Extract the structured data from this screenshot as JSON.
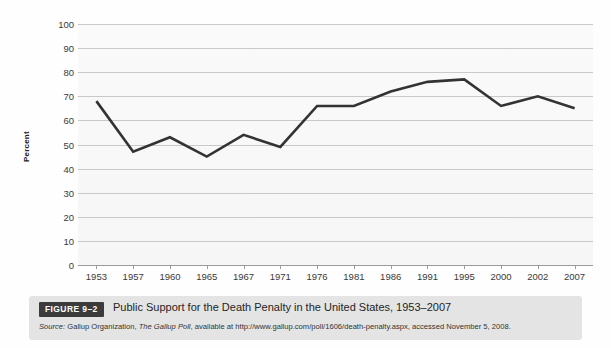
{
  "figure": {
    "badge": "FIGURE 9–2",
    "title": "Public Support for the Death Penalty in the United States, 1953–2007",
    "source_label": "Source:",
    "source_pre": " Gallup Organization, ",
    "source_publication": "The Gallup Poll",
    "source_post": ", available at http://www.gallup.com/poll/1606/death-penalty.aspx, accessed November 5, 2008."
  },
  "colors": {
    "line": "#333333",
    "gridline": "#c9c9c9",
    "axis": "#9a9a9a",
    "badge_bg": "#3b3b3b",
    "caption_bg": "#e4e4e4",
    "plot_bg": "#f8f8f8"
  },
  "chart_data": {
    "type": "line",
    "title": "Public Support for the Death Penalty in the United States, 1953–2007",
    "xlabel": "",
    "ylabel": "Percent",
    "ylim": [
      0,
      100
    ],
    "yticks": [
      0,
      10,
      20,
      30,
      40,
      50,
      60,
      70,
      80,
      90,
      100
    ],
    "ytick_labels": [
      "0",
      "10",
      "20",
      "30",
      "40",
      "50",
      "60",
      "70",
      "80",
      "90",
      "100"
    ],
    "grid": true,
    "legend": false,
    "categories": [
      "1953",
      "1957",
      "1960",
      "1965",
      "1967",
      "1971",
      "1976",
      "1981",
      "1986",
      "1991",
      "1995",
      "2000",
      "2002",
      "2007"
    ],
    "values": [
      68,
      47,
      53,
      45,
      54,
      49,
      66,
      66,
      72,
      76,
      77,
      66,
      70,
      65
    ]
  }
}
